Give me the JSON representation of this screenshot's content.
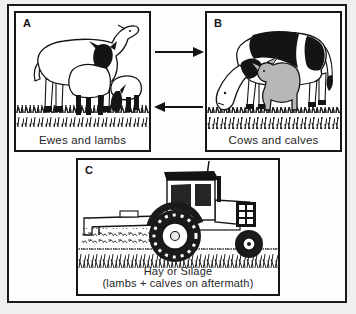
{
  "figure": {
    "panels": [
      {
        "letter": "A",
        "caption": "Ewes and lambs",
        "illustration": "ewe-and-two-lambs-grazing"
      },
      {
        "letter": "B",
        "caption": "Cows and calves",
        "illustration": "cow-grazing-with-calf"
      },
      {
        "letter": "C",
        "caption_line1": "Hay or Silage",
        "caption_line2": "(lambs + calves on aftermath)",
        "illustration": "tractor-mowing-hay"
      }
    ],
    "arrows": [
      {
        "name": "arrow-a-to-b",
        "direction": "right"
      },
      {
        "name": "arrow-b-to-a",
        "direction": "left"
      }
    ],
    "colors": {
      "page_background": "#f0efed",
      "panel_background": "#ffffff",
      "ink": "#1a1a1a",
      "calf_gray": "#b7b7b5"
    }
  }
}
